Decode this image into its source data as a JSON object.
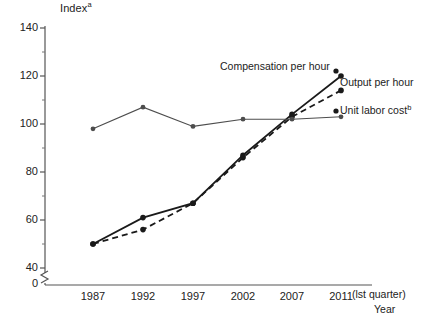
{
  "chart_data": {
    "type": "line",
    "title": "",
    "ylabel": "Index",
    "ylabel_superscript": "a",
    "xlabel": "Year",
    "x_axis_note": "(lst quarter)",
    "categories": [
      "1987",
      "1992",
      "1997",
      "2002",
      "2007",
      "2011"
    ],
    "xlim": [
      1987,
      2011
    ],
    "ylim": [
      40,
      140
    ],
    "y_axis_break": true,
    "y_zero_label": "0",
    "y_ticks_major": [
      "40",
      "60",
      "80",
      "100",
      "120",
      "140"
    ],
    "y_ticks_major_values": [
      40,
      60,
      80,
      100,
      120,
      140
    ],
    "y_ticks_minor_values": [
      50,
      70,
      90,
      110,
      130
    ],
    "grid": false,
    "legend_position": "inline-right",
    "series": [
      {
        "name": "Compensation per hour",
        "style": "solid",
        "color": "#1a1a1a",
        "values": [
          50,
          61,
          67,
          87,
          104,
          120
        ]
      },
      {
        "name": "Output per hour",
        "style": "dashed",
        "color": "#1a1a1a",
        "values": [
          50,
          56,
          67,
          86,
          103,
          114
        ]
      },
      {
        "name": "Unit labor cost",
        "name_superscript": "b",
        "style": "solid-thin",
        "color": "#4d4d4d",
        "values": [
          98,
          107,
          99,
          102,
          102,
          103
        ]
      }
    ]
  },
  "annotations": {
    "compensation_label": "Compensation per hour",
    "output_label": "Output per hour",
    "unit_labor_label": "Unit labor cost",
    "unit_labor_superscript": "b"
  }
}
